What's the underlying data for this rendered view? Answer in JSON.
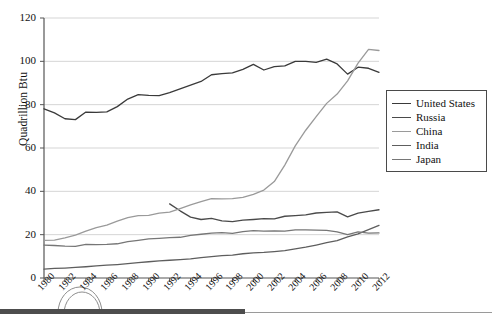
{
  "chart_data": {
    "type": "line",
    "title": "",
    "subtitle": "",
    "xlabel": "",
    "ylabel": "Quadrillion Btu",
    "xlim": [
      1980,
      2012
    ],
    "ylim": [
      0,
      120
    ],
    "yticks": [
      0,
      20,
      40,
      60,
      80,
      100,
      120
    ],
    "grid": "horizontal",
    "legend_position": "right",
    "x": [
      1980,
      1981,
      1982,
      1983,
      1984,
      1985,
      1986,
      1987,
      1988,
      1989,
      1990,
      1991,
      1992,
      1993,
      1994,
      1995,
      1996,
      1997,
      1998,
      1999,
      2000,
      2001,
      2002,
      2003,
      2004,
      2005,
      2006,
      2007,
      2008,
      2009,
      2010,
      2011,
      2012
    ],
    "xtick_labels": [
      "1980",
      "1982",
      "1984",
      "1986",
      "1988",
      "1990",
      "1992",
      "1994",
      "1996",
      "1998",
      "2000",
      "2002",
      "2004",
      "2006",
      "2008",
      "2010",
      "2012"
    ],
    "series": [
      {
        "name": "United States",
        "color": "#3a3a3a",
        "values": [
          78.1,
          76.2,
          73.5,
          73.1,
          76.6,
          76.4,
          76.7,
          79.1,
          82.6,
          84.6,
          84.3,
          84.2,
          85.6,
          87.3,
          89.0,
          90.7,
          93.8,
          94.3,
          94.7,
          96.3,
          98.6,
          96.0,
          97.6,
          97.9,
          100.0,
          100.0,
          99.5,
          101.0,
          98.8,
          94.1,
          97.3,
          96.8,
          94.9
        ]
      },
      {
        "name": "Russia",
        "color": "#4a4a4a",
        "values": [
          null,
          null,
          null,
          null,
          null,
          null,
          null,
          null,
          null,
          null,
          null,
          null,
          34.2,
          31.0,
          28.1,
          27.0,
          27.5,
          26.4,
          26.0,
          26.7,
          27.0,
          27.4,
          27.3,
          28.5,
          28.8,
          29.1,
          30.0,
          30.3,
          30.5,
          28.2,
          29.9,
          30.8,
          31.5
        ]
      },
      {
        "name": "China",
        "color": "#9a9a9a",
        "values": [
          17.4,
          17.5,
          18.5,
          19.8,
          21.6,
          23.3,
          24.4,
          26.2,
          27.9,
          28.8,
          28.9,
          29.9,
          30.4,
          32.0,
          33.7,
          35.2,
          36.6,
          36.5,
          36.6,
          37.2,
          38.6,
          40.6,
          44.5,
          52.1,
          61.0,
          68.2,
          74.5,
          80.6,
          84.9,
          91.0,
          99.2,
          105.5,
          105.0
        ]
      },
      {
        "name": "India",
        "color": "#5e5e5e",
        "values": [
          4.1,
          4.4,
          4.6,
          4.9,
          5.2,
          5.6,
          5.9,
          6.2,
          6.6,
          7.1,
          7.5,
          7.9,
          8.2,
          8.5,
          8.8,
          9.4,
          9.9,
          10.3,
          10.6,
          11.2,
          11.6,
          11.8,
          12.2,
          12.6,
          13.4,
          14.2,
          15.2,
          16.3,
          17.2,
          19.0,
          20.4,
          22.3,
          24.3
        ]
      },
      {
        "name": "Japan",
        "color": "#767676",
        "values": [
          15.2,
          15.0,
          14.7,
          14.6,
          15.5,
          15.4,
          15.5,
          15.8,
          16.8,
          17.4,
          18.1,
          18.3,
          18.6,
          18.8,
          19.7,
          20.2,
          20.7,
          20.9,
          20.6,
          21.4,
          21.9,
          21.6,
          21.7,
          21.6,
          22.2,
          22.2,
          22.1,
          22.0,
          21.3,
          20.0,
          21.3,
          20.7,
          20.8
        ]
      }
    ]
  },
  "axes": {
    "y_title": "Quadrillion Btu",
    "y_ticks": [
      "120",
      "100",
      "80",
      "60",
      "40",
      "20",
      "0"
    ],
    "x_ticks": [
      "1980",
      "1982",
      "1984",
      "1986",
      "1988",
      "1990",
      "1992",
      "1994",
      "1996",
      "1998",
      "2000",
      "2002",
      "2004",
      "2006",
      "2008",
      "2010",
      "2012"
    ]
  },
  "legend": {
    "items": [
      {
        "label": "United States",
        "color": "#3a3a3a"
      },
      {
        "label": "Russia",
        "color": "#4a4a4a"
      },
      {
        "label": "China",
        "color": "#9a9a9a"
      },
      {
        "label": "India",
        "color": "#5e5e5e"
      },
      {
        "label": "Japan",
        "color": "#767676"
      }
    ]
  },
  "colors": {
    "axis": "#555555",
    "gridline": "#d5d5d5",
    "plot_background": "#ffffff",
    "legend_border": "#4a4a4a",
    "bottom_bar": "#4d4d4d",
    "bottom_rule": "#9a9a9a"
  }
}
